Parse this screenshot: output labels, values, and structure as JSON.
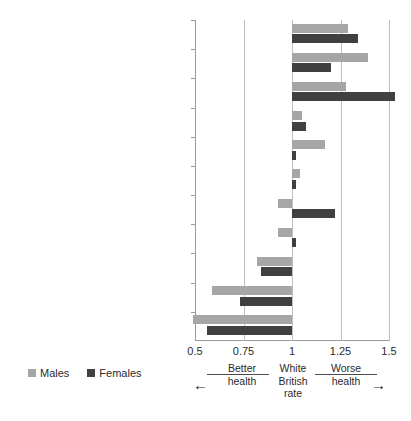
{
  "chart_title": "",
  "legend": {
    "position": "bottom-left",
    "entries": [
      {
        "label": "Males",
        "color": "#a6a6a6"
      },
      {
        "label": "Females",
        "color": "#404040"
      }
    ]
  },
  "annotations": {
    "better": "Better\nhealth",
    "better_line1": "Better",
    "better_line2": "health",
    "reference_line1": "White",
    "reference_line2": "British",
    "reference_line3": "rate",
    "worse_line1": "Worse",
    "worse_line2": "health",
    "arrow_left": "←",
    "arrow_right": "→"
  },
  "chart_data": {
    "type": "bar",
    "orientation": "horizontal",
    "title": "",
    "xlabel": "",
    "ylabel": "",
    "xlim": [
      0.5,
      1.5
    ],
    "xticks": [
      "0.5",
      "0.75",
      "1",
      "1.25",
      "1.5"
    ],
    "xtick_values": [
      0.5,
      0.75,
      1,
      1.25,
      1.5
    ],
    "baseline": 1,
    "grid": true,
    "legend_position": "bottom-left",
    "categories": [
      "Bangladeshi",
      "White Irish",
      "Pakistani",
      "Mixed White & Black Caribbean",
      "Black Caribbean",
      "Mixed White & Black African",
      "Indian",
      "Mixed White & Asian",
      "Other White",
      "Black African",
      "Chinese"
    ],
    "series": [
      {
        "name": "Males",
        "color": "#a6a6a6",
        "values": [
          1.29,
          1.39,
          1.28,
          1.05,
          1.17,
          1.04,
          0.93,
          0.93,
          0.82,
          0.59,
          0.49
        ]
      },
      {
        "name": "Females",
        "color": "#404040",
        "values": [
          1.34,
          1.2,
          1.53,
          1.07,
          1.02,
          1.02,
          1.22,
          1.02,
          0.84,
          0.73,
          0.56
        ]
      }
    ]
  }
}
